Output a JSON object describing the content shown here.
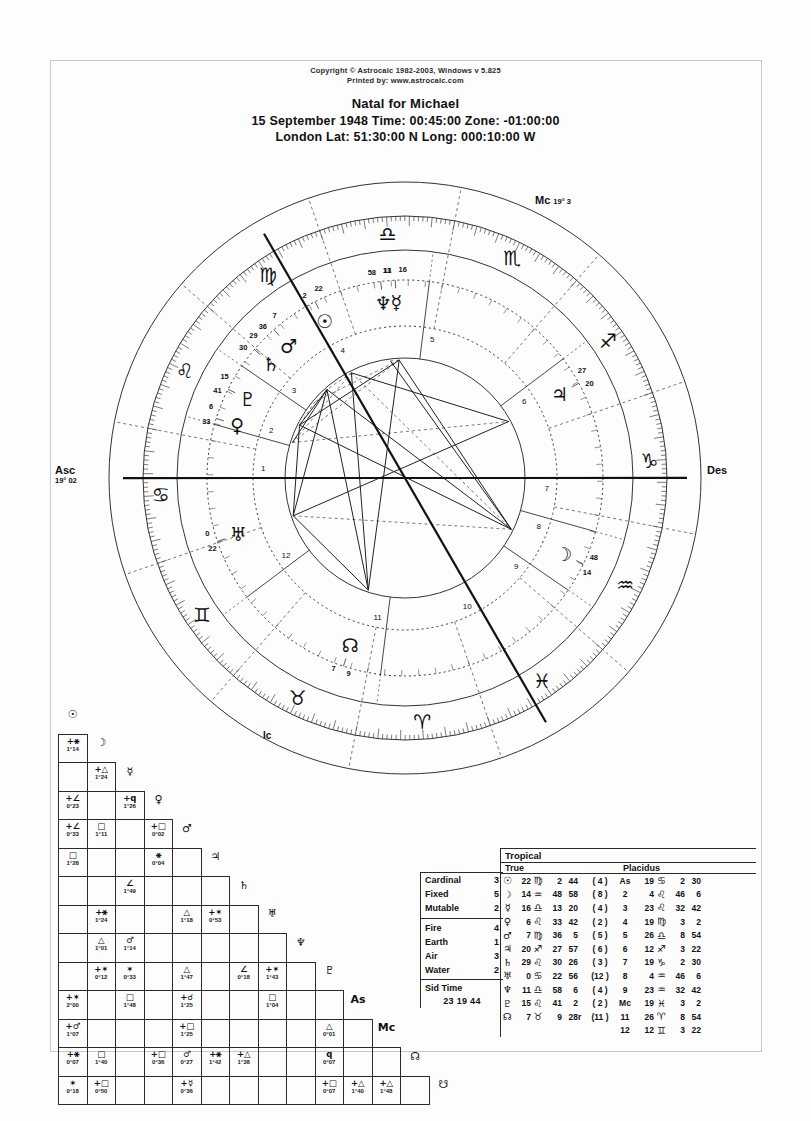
{
  "header": {
    "copyright_line1": "Copyright © Astrocalc 1982-2003, Windows v 5.825",
    "copyright_line2": "Printed by: www.astrocalc.com",
    "title": "Natal for Michael",
    "line2": "15 September 1948   Time: 00:45:00   Zone: -01:00:00",
    "line3": "London     Lat: 51:30:00 N  Long: 000:10:00 W"
  },
  "wheel": {
    "asc_label": "Asc",
    "asc_value": "19° 02",
    "des_label": "Des",
    "mc_label": "Mc",
    "mc_value": "19° 3",
    "ic_label": "Ic",
    "house_numbers": [
      "1",
      "2",
      "3",
      "4",
      "5",
      "6",
      "7",
      "8",
      "9",
      "10",
      "11",
      "12"
    ],
    "sign_glyphs": [
      "♈",
      "♉",
      "♊",
      "♋",
      "♌",
      "♍",
      "♎",
      "♏",
      "♐",
      "♑",
      "♒",
      "♓"
    ],
    "planets": [
      {
        "glyph": "♄",
        "name": "uranus",
        "deg": "0",
        "min": "23"
      },
      {
        "glyph": "♀",
        "name": "venus",
        "deg": "6",
        "min": "33"
      },
      {
        "glyph": "♇",
        "name": "pluto",
        "deg": "15",
        "min": "41"
      },
      {
        "glyph": "♄",
        "name": "saturn",
        "deg": "29",
        "min": "30"
      },
      {
        "glyph": "☉",
        "name": "sun",
        "deg": "22",
        "min": "2"
      },
      {
        "glyph": "♆",
        "name": "neptune",
        "deg": "11",
        "min": "58"
      },
      {
        "glyph": "☿",
        "name": "mercury",
        "deg": "16",
        "min": "13"
      },
      {
        "glyph": "♂",
        "name": "mars",
        "deg": "7",
        "min": "36"
      },
      {
        "glyph": "♃",
        "name": "jupiter",
        "deg": "20",
        "min": "27"
      },
      {
        "glyph": "☽",
        "name": "moon",
        "deg": "14",
        "min": "48"
      },
      {
        "glyph": "⊕",
        "name": "part-of-fortune",
        "deg": "16",
        "min": "26"
      },
      {
        "glyph": "☊",
        "name": "north-node",
        "deg": "7",
        "min": "9"
      }
    ]
  },
  "aspect_grid": {
    "planets": [
      "☉",
      "☽",
      "☿",
      "♀",
      "♂",
      "♃",
      "♄",
      "♅",
      "♆",
      "♇",
      "As",
      "Mc",
      "☊",
      "☊"
    ],
    "rows": [
      {
        "sym": "☉",
        "cells": []
      },
      {
        "sym": "☽",
        "cells": [
          {
            "i": 0,
            "a": "+⚹",
            "o": "1°14"
          }
        ]
      },
      {
        "sym": "☿",
        "cells": [
          {
            "i": 0,
            "a": ""
          },
          {
            "i": 1,
            "a": "+△",
            "o": "1°24"
          }
        ]
      },
      {
        "sym": "♀",
        "cells": [
          {
            "i": 0,
            "a": "+∠",
            "o": "0°23"
          },
          {
            "i": 1,
            "a": ""
          },
          {
            "i": 2,
            "a": "+q",
            "o": "1°26"
          }
        ]
      },
      {
        "sym": "♂",
        "cells": [
          {
            "i": 0,
            "a": "+∠",
            "o": "0°33"
          },
          {
            "i": 1,
            "a": "□",
            "o": "1°11"
          },
          {
            "i": 2,
            "a": ""
          },
          {
            "i": 3,
            "a": "+□",
            "o": "0°02"
          }
        ]
      },
      {
        "sym": "♃",
        "cells": [
          {
            "i": 0,
            "a": "□",
            "o": "1°28"
          },
          {
            "i": 1,
            "a": ""
          },
          {
            "i": 2,
            "a": ""
          },
          {
            "i": 3,
            "a": "⚹",
            "o": "0°04"
          }
        ]
      },
      {
        "sym": "♄",
        "cells": [
          {
            "i": 0,
            "a": ""
          },
          {
            "i": 1,
            "a": ""
          },
          {
            "i": 2,
            "a": "∠",
            "o": "1°49"
          }
        ]
      },
      {
        "sym": "♅",
        "cells": [
          {
            "i": 0,
            "a": ""
          },
          {
            "i": 1,
            "a": "+⚹",
            "o": "1°24"
          },
          {
            "i": 2,
            "a": ""
          },
          {
            "i": 3,
            "a": ""
          },
          {
            "i": 4,
            "a": "△",
            "o": "1°18"
          },
          {
            "i": 5,
            "a": "+✶",
            "o": "0°53"
          }
        ]
      },
      {
        "sym": "♆",
        "cells": [
          {
            "i": 0,
            "a": ""
          },
          {
            "i": 1,
            "a": "△",
            "o": "1°01"
          },
          {
            "i": 2,
            "a": "♂",
            "o": "1°14"
          }
        ]
      },
      {
        "sym": "♇",
        "cells": [
          {
            "i": 0,
            "a": ""
          },
          {
            "i": 1,
            "a": "+✶",
            "o": "0°12"
          },
          {
            "i": 2,
            "a": "✶",
            "o": "0°33"
          },
          {
            "i": 3,
            "a": ""
          },
          {
            "i": 4,
            "a": "△",
            "o": "1°47"
          },
          {
            "i": 5,
            "a": ""
          },
          {
            "i": 6,
            "a": "∠",
            "o": "0°18"
          },
          {
            "i": 7,
            "a": "+✶",
            "o": "1°43"
          }
        ]
      },
      {
        "sym": "As",
        "cells": [
          {
            "i": 0,
            "a": "+✶",
            "o": "2°00"
          },
          {
            "i": 1,
            "a": ""
          },
          {
            "i": 2,
            "a": "□",
            "o": "1°48"
          },
          {
            "i": 3,
            "a": ""
          },
          {
            "i": 4,
            "a": "+☌",
            "o": "1°25"
          },
          {
            "i": 5,
            "a": ""
          },
          {
            "i": 6,
            "a": ""
          },
          {
            "i": 7,
            "a": "□",
            "o": "1°04"
          }
        ]
      },
      {
        "sym": "Mc",
        "cells": [
          {
            "i": 0,
            "a": "+♂",
            "o": "1°07"
          },
          {
            "i": 1,
            "a": ""
          },
          {
            "i": 2,
            "a": ""
          },
          {
            "i": 3,
            "a": ""
          },
          {
            "i": 4,
            "a": "+□",
            "o": "1°25"
          },
          {
            "i": 5,
            "a": ""
          },
          {
            "i": 6,
            "a": ""
          },
          {
            "i": 7,
            "a": ""
          },
          {
            "i": 8,
            "a": ""
          },
          {
            "i": 9,
            "a": "△",
            "o": "0°01"
          }
        ]
      },
      {
        "sym": "☊",
        "cells": [
          {
            "i": 0,
            "a": "+⚹",
            "o": "0°07"
          },
          {
            "i": 1,
            "a": "□",
            "o": "1°40"
          },
          {
            "i": 2,
            "a": ""
          },
          {
            "i": 3,
            "a": "+□",
            "o": "0°36"
          },
          {
            "i": 4,
            "a": "♂",
            "o": "0°27"
          },
          {
            "i": 5,
            "a": "+⚹",
            "o": "1°42"
          },
          {
            "i": 6,
            "a": "+△",
            "o": "1°38"
          },
          {
            "i": 7,
            "a": ""
          },
          {
            "i": 8,
            "a": ""
          },
          {
            "i": 9,
            "a": "q",
            "o": "0°07"
          }
        ]
      },
      {
        "sym": "☋",
        "cells": [
          {
            "i": 0,
            "a": "✶",
            "o": "0°18"
          },
          {
            "i": 1,
            "a": "+□",
            "o": "0°50"
          },
          {
            "i": 2,
            "a": ""
          },
          {
            "i": 3,
            "a": ""
          },
          {
            "i": 4,
            "a": "+☿",
            "o": "0°36"
          },
          {
            "i": 5,
            "a": ""
          },
          {
            "i": 6,
            "a": ""
          },
          {
            "i": 7,
            "a": ""
          },
          {
            "i": 8,
            "a": ""
          },
          {
            "i": 9,
            "a": "+□",
            "o": "0°07"
          },
          {
            "i": 10,
            "a": "+△",
            "o": "1°40"
          },
          {
            "i": 11,
            "a": "+△",
            "o": "1°48"
          }
        ]
      }
    ]
  },
  "tables": {
    "tropical_label": "Tropical",
    "true_label": "True",
    "placidus_label": "Placidus",
    "modalities": [
      {
        "name": "Cardinal",
        "count": "3"
      },
      {
        "name": "Fixed",
        "count": "5"
      },
      {
        "name": "Mutable",
        "count": "2"
      }
    ],
    "elements": [
      {
        "name": "Fire",
        "count": "4"
      },
      {
        "name": "Earth",
        "count": "1"
      },
      {
        "name": "Air",
        "count": "3"
      },
      {
        "name": "Water",
        "count": "2"
      }
    ],
    "sid_time_label": "Sid Time",
    "sid_time_value": "23 19 44",
    "planet_positions": [
      {
        "glyph": "☉",
        "deg": "22",
        "sign": "♍",
        "min": "2",
        "sec": "44",
        "retro": "",
        "house": "( 4 )"
      },
      {
        "glyph": "☽",
        "deg": "14",
        "sign": "♒",
        "min": "48",
        "sec": "58",
        "retro": "",
        "house": "( 8 )"
      },
      {
        "glyph": "☿",
        "deg": "16",
        "sign": "♎",
        "min": "13",
        "sec": "20",
        "retro": "",
        "house": "( 4 )"
      },
      {
        "glyph": "♀",
        "deg": "6",
        "sign": "♌",
        "min": "33",
        "sec": "42",
        "retro": "",
        "house": "( 2 )"
      },
      {
        "glyph": "♂",
        "deg": "7",
        "sign": "♍",
        "min": "36",
        "sec": "5",
        "retro": "",
        "house": "( 5 )"
      },
      {
        "glyph": "♃",
        "deg": "20",
        "sign": "♐",
        "min": "27",
        "sec": "57",
        "retro": "",
        "house": "( 6 )"
      },
      {
        "glyph": "♄",
        "deg": "29",
        "sign": "♌",
        "min": "30",
        "sec": "26",
        "retro": "",
        "house": "( 3 )"
      },
      {
        "glyph": "♅",
        "deg": "0",
        "sign": "♋",
        "min": "22",
        "sec": "56",
        "retro": "",
        "house": "(12 )"
      },
      {
        "glyph": "♆",
        "deg": "11",
        "sign": "♎",
        "min": "58",
        "sec": "6",
        "retro": "",
        "house": "( 4 )"
      },
      {
        "glyph": "♇",
        "deg": "15",
        "sign": "♌",
        "min": "41",
        "sec": "2",
        "retro": "",
        "house": "( 2 )"
      },
      {
        "glyph": "☊",
        "deg": "7",
        "sign": "♉",
        "min": "9",
        "sec": "28",
        "retro": "r",
        "house": "(11 )"
      }
    ],
    "house_cusps": [
      {
        "label": "As",
        "deg": "19",
        "sign": "♋",
        "min": "2",
        "sec": "30"
      },
      {
        "label": "2",
        "deg": "4",
        "sign": "♌",
        "min": "46",
        "sec": "6"
      },
      {
        "label": "3",
        "deg": "23",
        "sign": "♌",
        "min": "32",
        "sec": "42"
      },
      {
        "label": "4",
        "deg": "19",
        "sign": "♍",
        "min": "3",
        "sec": "2"
      },
      {
        "label": "5",
        "deg": "26",
        "sign": "♎",
        "min": "8",
        "sec": "54"
      },
      {
        "label": "6",
        "deg": "12",
        "sign": "♐",
        "min": "3",
        "sec": "22"
      },
      {
        "label": "7",
        "deg": "19",
        "sign": "♑",
        "min": "2",
        "sec": "30"
      },
      {
        "label": "8",
        "deg": "4",
        "sign": "♒",
        "min": "46",
        "sec": "6"
      },
      {
        "label": "9",
        "deg": "23",
        "sign": "♒",
        "min": "32",
        "sec": "42"
      },
      {
        "label": "Mc",
        "deg": "19",
        "sign": "♓",
        "min": "3",
        "sec": "2"
      },
      {
        "label": "11",
        "deg": "26",
        "sign": "♈",
        "min": "8",
        "sec": "54"
      },
      {
        "label": "12",
        "deg": "12",
        "sign": "♊",
        "min": "3",
        "sec": "22"
      }
    ]
  }
}
